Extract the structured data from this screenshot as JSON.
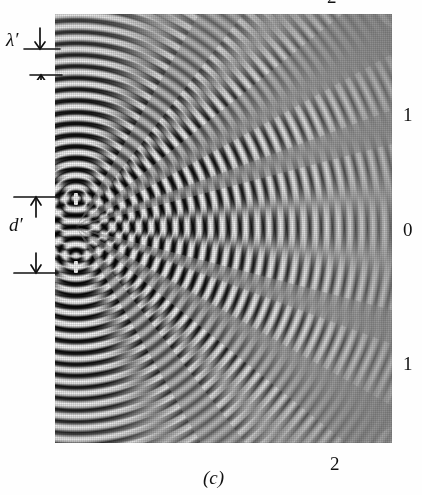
{
  "figure": {
    "caption": "(c)",
    "kind": "ripple-tank-two-source-interference-photograph"
  },
  "annotations": {
    "wavelength_label": "λ′",
    "separation_label": "d′"
  },
  "nodal_line_labels": {
    "top_cropped": "2",
    "upper": "1",
    "center": "0",
    "lower": "1",
    "bottom": "2"
  },
  "colors": {
    "page_background": "#ffffff",
    "ink": "#111111",
    "photo_mid_gray": "#8a8a8a",
    "photo_dark": "#141414",
    "photo_light": "#f2f2f2"
  },
  "pattern": {
    "source_count": 2,
    "source_separation_px": 56,
    "wavelength_px": 23,
    "source_1": {
      "x": 76,
      "y": 199
    },
    "source_2": {
      "x": 76,
      "y": 255
    },
    "photo_frame": {
      "left": 55,
      "top": 14,
      "width": 337,
      "height": 429
    }
  }
}
